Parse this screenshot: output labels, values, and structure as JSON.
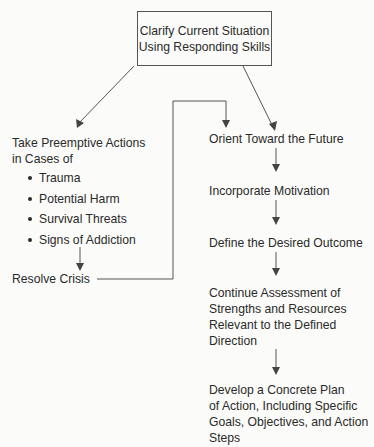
{
  "diagram": {
    "top_box": {
      "line1": "Clarify Current Situation",
      "line2": "Using Responding Skills"
    },
    "left_branch": {
      "heading_line1": "Take Preemptive Actions",
      "heading_line2": "in Cases of",
      "bullets": [
        "Trauma",
        "Potential Harm",
        "Survival Threats",
        "Signs of Addiction"
      ],
      "resolve": "Resolve Crisis"
    },
    "right_branch": {
      "steps": [
        {
          "lines": [
            "Orient Toward the Future"
          ]
        },
        {
          "lines": [
            "Incorporate Motivation"
          ]
        },
        {
          "lines": [
            "Define the Desired Outcome"
          ]
        },
        {
          "lines": [
            "Continue Assessment of",
            "Strengths and Resources",
            "Relevant to the Defined",
            "Direction"
          ]
        },
        {
          "lines": [
            "Develop a Concrete Plan",
            "of Action, Including Specific",
            "Goals, Objectives, and Action",
            "Steps"
          ]
        }
      ]
    },
    "colors": {
      "line": "#555555",
      "text": "#2a2a2a",
      "background": "#fbfbf9"
    }
  }
}
